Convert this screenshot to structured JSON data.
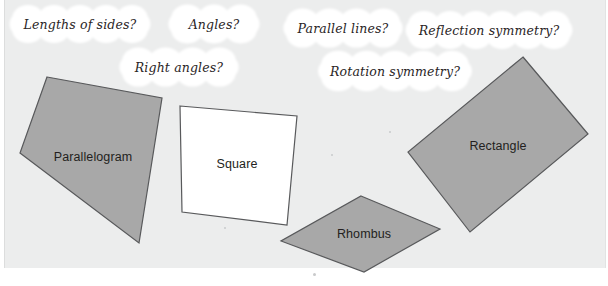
{
  "canvas": {
    "width": 608,
    "height": 286
  },
  "colors": {
    "panel_background": "#eceded",
    "shape_fill_gray": "#a8a8a8",
    "shape_fill_white": "#ffffff",
    "shape_outline": "#58595b",
    "cloud_fill": "#ffffff",
    "text": "#231f20",
    "page_background": "#ffffff"
  },
  "clouds": [
    {
      "text": "Lengths of sides?",
      "cx": 80,
      "cy": 24,
      "rx": 65,
      "ry": 15
    },
    {
      "text": "Angles?",
      "cx": 214,
      "cy": 24,
      "rx": 40,
      "ry": 15
    },
    {
      "text": "Parallel lines?",
      "cx": 343,
      "cy": 28,
      "rx": 54,
      "ry": 15
    },
    {
      "text": "Reflection symmetry?",
      "cx": 489,
      "cy": 30,
      "rx": 78,
      "ry": 15
    },
    {
      "text": "Right angles?",
      "cx": 179,
      "cy": 67,
      "rx": 54,
      "ry": 15
    },
    {
      "text": "Rotation symmetry?",
      "cx": 395,
      "cy": 71,
      "rx": 71,
      "ry": 15
    }
  ],
  "shapes": [
    {
      "name": "parallelogram",
      "label": "Parallelogram",
      "fill": "#a8a8a8",
      "points": "47,77 162,98 139,243 20,153",
      "label_x": 93,
      "label_y": 157
    },
    {
      "name": "square",
      "label": "Square",
      "fill": "#ffffff",
      "points": "180,106 297,116 287,225 182,212",
      "label_x": 237,
      "label_y": 164
    },
    {
      "name": "rhombus",
      "label": "Rhombus",
      "fill": "#a8a8a8",
      "points": "361,196 440,229 364,272 281,241",
      "label_x": 364,
      "label_y": 234
    },
    {
      "name": "rectangle",
      "label": "Rectangle",
      "fill": "#a8a8a8",
      "points": "523,57 588,134 470,232 408,152",
      "label_x": 498,
      "label_y": 146
    }
  ],
  "specks": [
    {
      "x": 331,
      "y": 154,
      "size": 2
    },
    {
      "x": 224,
      "y": 227,
      "size": 2
    },
    {
      "x": 313,
      "y": 273,
      "size": 3
    },
    {
      "x": 389,
      "y": 131,
      "size": 2
    }
  ]
}
